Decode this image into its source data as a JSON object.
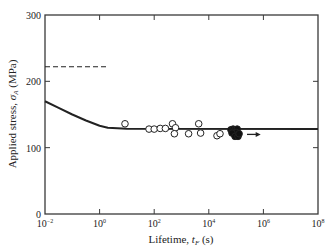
{
  "chart_data": {
    "type": "scatter",
    "title": "",
    "xlabel": "Lifetime, t_F (s)",
    "ylabel": "Applied stress, σ_A (MPa)",
    "xscale": "log",
    "xlim_log10": [
      -2,
      8
    ],
    "ylim": [
      0,
      300
    ],
    "x_ticks": [
      "10^-2",
      "10^0",
      "10^2",
      "10^4",
      "10^6",
      "10^8"
    ],
    "x_tick_log10": [
      -2,
      0,
      2,
      4,
      6,
      8
    ],
    "y_ticks": [
      0,
      100,
      200,
      300
    ],
    "grid": false,
    "legend": null,
    "series": [
      {
        "name": "open circles (failed specimens)",
        "marker": "open-circle",
        "points_log10t_stress": [
          [
            0.93,
            136
          ],
          [
            1.81,
            128
          ],
          [
            2.0,
            128
          ],
          [
            2.22,
            129
          ],
          [
            2.41,
            129
          ],
          [
            2.67,
            136
          ],
          [
            2.78,
            130
          ],
          [
            2.74,
            121
          ],
          [
            3.26,
            121
          ],
          [
            3.63,
            136
          ],
          [
            3.7,
            122
          ],
          [
            4.3,
            118
          ],
          [
            4.41,
            121
          ]
        ]
      },
      {
        "name": "filled circles (runouts / unbroken)",
        "marker": "filled-circle",
        "points_log10t_stress": [
          [
            4.81,
            127
          ],
          [
            4.89,
            128
          ],
          [
            4.96,
            127
          ],
          [
            5.04,
            128
          ],
          [
            4.92,
            122
          ],
          [
            5.0,
            123
          ],
          [
            4.85,
            122
          ],
          [
            4.96,
            117
          ],
          [
            5.07,
            117
          ],
          [
            5.11,
            121
          ]
        ]
      },
      {
        "name": "fitted curve",
        "style": "solid-line",
        "points_log10t_stress": [
          [
            -2,
            170
          ],
          [
            -1.5,
            160
          ],
          [
            -1,
            150
          ],
          [
            -0.5,
            141
          ],
          [
            0,
            133
          ],
          [
            0.3,
            130
          ],
          [
            1,
            128.5
          ],
          [
            8,
            128
          ]
        ]
      },
      {
        "name": "dashed reference level",
        "style": "dashed-line",
        "points_log10t_stress": [
          [
            -2,
            222
          ],
          [
            0.3,
            222
          ]
        ]
      }
    ],
    "annotations": [
      {
        "type": "arrow",
        "direction": "right",
        "from_log10t": 5.4,
        "to_log10t": 5.9,
        "stress": 120,
        "meaning": "runout beyond"
      }
    ]
  },
  "labels": {
    "xlabel_main": "Lifetime, ",
    "xlabel_sym": "t",
    "xlabel_sub": "F",
    "xlabel_unit": " (s)",
    "ylabel_main": "Applied stress, ",
    "ylabel_sym": "σ",
    "ylabel_sub": "A",
    "ylabel_unit": " (MPa)",
    "x_tick_base": "10",
    "x_tick_exps": [
      "−2",
      "0",
      "2",
      "4",
      "6",
      "8"
    ],
    "y_tick_labels": [
      "0",
      "100",
      "200",
      "300"
    ]
  }
}
